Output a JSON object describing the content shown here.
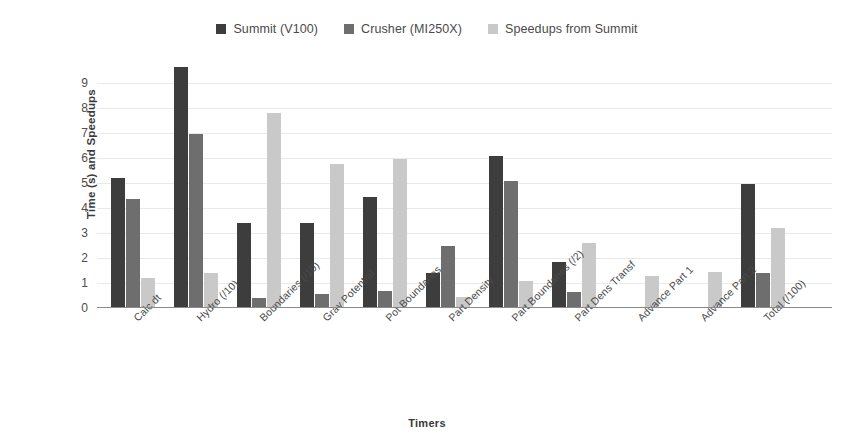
{
  "chart_data": {
    "type": "bar",
    "title": "",
    "xlabel": "Timers",
    "ylabel": "Time (s) and Speedups",
    "ylim": [
      0,
      9.8
    ],
    "yticks": [
      0,
      1,
      2,
      3,
      4,
      5,
      6,
      7,
      8,
      9
    ],
    "grid": true,
    "legend_position": "top-center",
    "categories": [
      "Calc dt",
      "Hydro (/10)",
      "Boundaries (/10)",
      "Grav Potential",
      "Pot Boundaries",
      "Part Density",
      "Part Boundaries (/2)",
      "Part Dens Transf",
      "Advance Part 1",
      "Advance Part 2",
      "Total (/100)"
    ],
    "series": [
      {
        "name": "Summit (V100)",
        "color": "#3d3d3d",
        "values": [
          5.2,
          9.65,
          3.4,
          3.4,
          4.45,
          1.4,
          6.1,
          1.85,
          0,
          0,
          4.95
        ]
      },
      {
        "name": "Crusher (MI250X)",
        "color": "#6e6e6e",
        "values": [
          4.35,
          6.95,
          0.4,
          0.55,
          0.7,
          2.5,
          5.1,
          0.65,
          0,
          0,
          1.4
        ]
      },
      {
        "name": "Speedups from Summit",
        "color": "#c9c9c9",
        "values": [
          1.2,
          1.4,
          7.8,
          5.75,
          5.95,
          0.45,
          1.1,
          2.6,
          1.3,
          1.45,
          3.2
        ]
      }
    ]
  }
}
